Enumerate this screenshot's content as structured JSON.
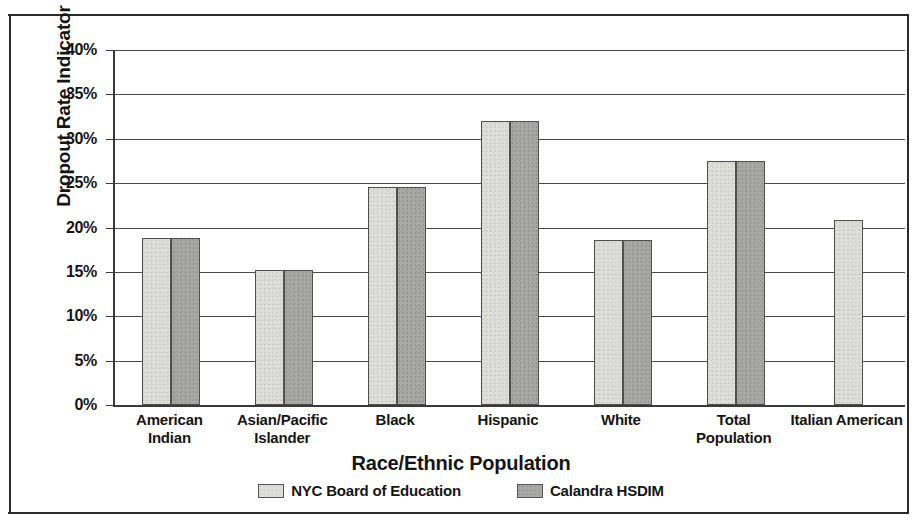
{
  "chart_data": {
    "type": "bar",
    "title": "",
    "xlabel": "Race/Ethnic Population",
    "ylabel": "Dropout Rate Indicator",
    "categories": [
      "American Indian",
      "Asian/Pacific Islander",
      "Black",
      "Hispanic",
      "White",
      "Total Population",
      "Italian American"
    ],
    "series": [
      {
        "name": "NYC Board of Education",
        "color": "#dededb",
        "values": [
          18.8,
          15.2,
          24.6,
          32.0,
          18.6,
          27.5,
          20.9
        ]
      },
      {
        "name": "Calandra HSDIM",
        "color": "#a8a8a6",
        "values": [
          18.8,
          15.2,
          24.6,
          32.0,
          18.6,
          27.5,
          null
        ]
      }
    ],
    "ylim": [
      0,
      40
    ],
    "ytick_labels": [
      "40%",
      "35%",
      "30%",
      "25%",
      "20%",
      "15%",
      "10%",
      "5%",
      "0%"
    ],
    "ytick_values": [
      40,
      35,
      30,
      25,
      20,
      15,
      10,
      5,
      0
    ],
    "grid": true,
    "legend_position": "bottom"
  },
  "axes": {
    "y_title": "Dropout Rate Indicator",
    "x_title": "Race/Ethnic Population"
  },
  "legend": {
    "items": [
      {
        "label": "NYC Board of Education",
        "swatch": "light-gray-swatch"
      },
      {
        "label": "Calandra HSDIM",
        "swatch": "dark-gray-swatch"
      }
    ]
  }
}
